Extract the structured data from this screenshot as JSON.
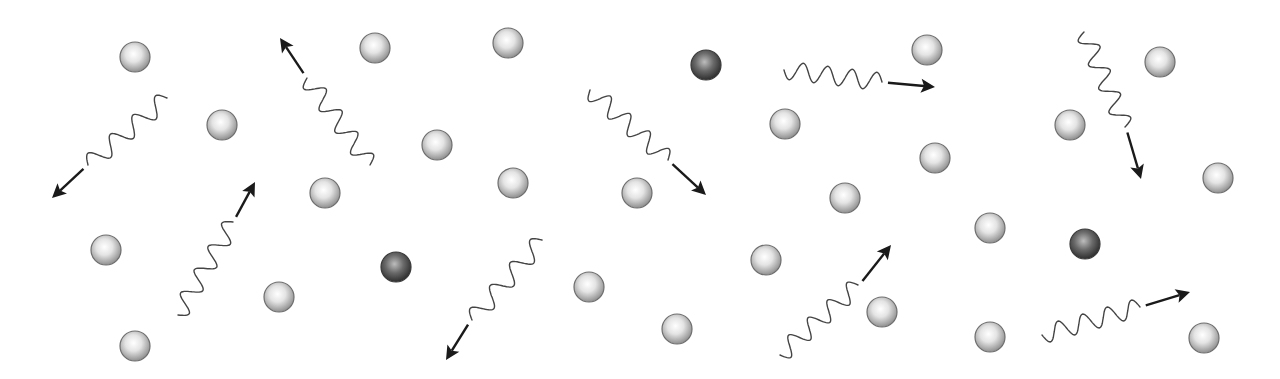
{
  "diagram": {
    "colors": {
      "background": "#ffffff",
      "light_particle_fill_center": "#ffffff",
      "light_particle_fill_edge": "#8f8f8f",
      "light_particle_stroke": "#6e6e6e",
      "dark_particle_fill_center": "#bdbdbd",
      "dark_particle_fill_edge": "#2e2e2e",
      "wave_stroke": "#444444",
      "arrow_color": "#1a1a1a"
    },
    "particle_radius": 15,
    "light_particles": [
      [
        135,
        57
      ],
      [
        222,
        125
      ],
      [
        375,
        48
      ],
      [
        508,
        43
      ],
      [
        437,
        145
      ],
      [
        325,
        193
      ],
      [
        513,
        183
      ],
      [
        106,
        250
      ],
      [
        279,
        297
      ],
      [
        135,
        346
      ],
      [
        589,
        287
      ],
      [
        637,
        193
      ],
      [
        677,
        329
      ],
      [
        785,
        124
      ],
      [
        927,
        50
      ],
      [
        935,
        158
      ],
      [
        766,
        260
      ],
      [
        845,
        198
      ],
      [
        882,
        312
      ],
      [
        990,
        228
      ],
      [
        990,
        337
      ],
      [
        1070,
        125
      ],
      [
        1160,
        62
      ],
      [
        1218,
        178
      ],
      [
        1204,
        338
      ]
    ],
    "dark_particles": [
      [
        706,
        65
      ],
      [
        396,
        267
      ],
      [
        1085,
        244
      ]
    ],
    "photons": [
      {
        "start": [
          167,
          98
        ],
        "end": [
          88,
          165
        ],
        "arrow_tip": [
          52,
          198
        ],
        "cycles": 3.5,
        "amp": 9
      },
      {
        "start": [
          370,
          165
        ],
        "end": [
          307,
          78
        ],
        "arrow_tip": [
          280,
          38
        ],
        "cycles": 4,
        "amp": 9
      },
      {
        "start": [
          178,
          315
        ],
        "end": [
          233,
          222
        ],
        "arrow_tip": [
          255,
          182
        ],
        "cycles": 4,
        "amp": 9
      },
      {
        "start": [
          542,
          240
        ],
        "end": [
          472,
          320
        ],
        "arrow_tip": [
          446,
          360
        ],
        "cycles": 3.5,
        "amp": 9
      },
      {
        "start": [
          590,
          90
        ],
        "end": [
          668,
          160
        ],
        "arrow_tip": [
          706,
          195
        ],
        "cycles": 4,
        "amp": 9
      },
      {
        "start": [
          784,
          70
        ],
        "end": [
          882,
          82
        ],
        "arrow_tip": [
          935,
          87
        ],
        "cycles": 4,
        "amp": 9
      },
      {
        "start": [
          1084,
          32
        ],
        "end": [
          1125,
          127
        ],
        "arrow_tip": [
          1141,
          179
        ],
        "cycles": 4,
        "amp": 9
      },
      {
        "start": [
          780,
          355
        ],
        "end": [
          858,
          285
        ],
        "arrow_tip": [
          891,
          245
        ],
        "cycles": 4,
        "amp": 9
      },
      {
        "start": [
          1042,
          335
        ],
        "end": [
          1140,
          307
        ],
        "arrow_tip": [
          1190,
          292
        ],
        "cycles": 4,
        "amp": 9
      }
    ]
  }
}
